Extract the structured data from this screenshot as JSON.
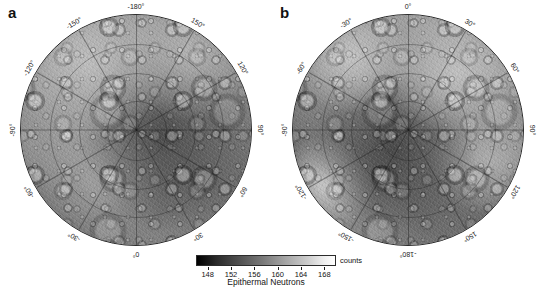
{
  "figure": {
    "panels": [
      {
        "letter": "a",
        "pole": "south",
        "center_longitude_top": "-180°",
        "lon_labels": [
          {
            "text": "-180°",
            "angle_deg": 0
          },
          {
            "text": "150°",
            "angle_deg": 30
          },
          {
            "text": "120°",
            "angle_deg": 60
          },
          {
            "text": "90°",
            "angle_deg": 90
          },
          {
            "text": "60°",
            "angle_deg": 120
          },
          {
            "text": "30°",
            "angle_deg": 150
          },
          {
            "text": "0°",
            "angle_deg": 180
          },
          {
            "text": "-30°",
            "angle_deg": 210
          },
          {
            "text": "-60°",
            "angle_deg": 240
          },
          {
            "text": "-90°",
            "angle_deg": 270
          },
          {
            "text": "-120°",
            "angle_deg": 300
          },
          {
            "text": "-150°",
            "angle_deg": 330
          }
        ]
      },
      {
        "letter": "b",
        "pole": "north",
        "center_longitude_top": "0°",
        "lon_labels": [
          {
            "text": "0°",
            "angle_deg": 0
          },
          {
            "text": "30°",
            "angle_deg": 30
          },
          {
            "text": "60°",
            "angle_deg": 60
          },
          {
            "text": "90°",
            "angle_deg": 90
          },
          {
            "text": "120°",
            "angle_deg": 120
          },
          {
            "text": "150°",
            "angle_deg": 150
          },
          {
            "text": "-180°",
            "angle_deg": 180
          },
          {
            "text": "-150°",
            "angle_deg": 210
          },
          {
            "text": "-120°",
            "angle_deg": 240
          },
          {
            "text": "-90°",
            "angle_deg": 270
          },
          {
            "text": "-60°",
            "angle_deg": 300
          },
          {
            "text": "-30°",
            "angle_deg": 330
          }
        ]
      }
    ]
  },
  "chart_data": {
    "type": "heatmap",
    "title": "Epithermal Neutrons",
    "subtitle": "",
    "xlabel": "",
    "ylabel": "",
    "projection": "polar stereographic",
    "panel_count": 2,
    "panel_labels": [
      "a",
      "b"
    ],
    "colorbar": {
      "label": "Epithermal Neutrons",
      "unit": "counts",
      "unit_label": "counts",
      "ticks": [
        148,
        152,
        156,
        160,
        164,
        168
      ],
      "tick_labels": [
        "148",
        "152",
        "156",
        "160",
        "164",
        "168"
      ],
      "range": [
        146,
        170
      ],
      "colormap": "grayscale",
      "colormap_low_color": "#000000",
      "colormap_high_color": "#ffffff",
      "orientation": "horizontal"
    },
    "grid": true,
    "legend_position": "bottom-center",
    "graticule": {
      "meridian_spacing_deg": 30,
      "parallel_circles": 3
    }
  }
}
